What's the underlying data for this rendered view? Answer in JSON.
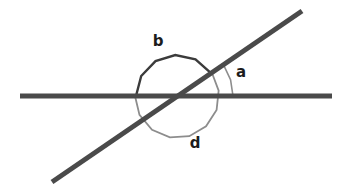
{
  "figure": {
    "width": 345,
    "height": 194,
    "background_color": "#ffffff"
  },
  "colors": {
    "line_stroke": "#4a4a4a",
    "arc_dark": "#3b3b3b",
    "arc_light": "#8d8d8d",
    "label_text": "#1c1c1c"
  },
  "lines": [
    {
      "name": "horizontal-line",
      "x1": 20,
      "y1": 96,
      "x2": 332,
      "y2": 96,
      "stroke_width": 5,
      "color": "#4a4a4a"
    },
    {
      "name": "transversal-line",
      "x1": 52,
      "y1": 182,
      "x2": 302,
      "y2": 11,
      "stroke_width": 5,
      "color": "#4a4a4a"
    }
  ],
  "intersection": {
    "x": 177,
    "y": 96
  },
  "arcs": [
    {
      "name": "angle-arc-a",
      "label": "a",
      "radius": 56,
      "start_deg": 0,
      "end_deg": 34,
      "color": "#8d8d8d",
      "stroke_width": 1.6,
      "label_x": 241,
      "label_y": 72
    },
    {
      "name": "angle-arc-b",
      "label": "b",
      "radius": 41,
      "start_deg": 34,
      "end_deg": 180,
      "color": "#3b3b3b",
      "stroke_width": 2.4,
      "label_x": 158,
      "label_y": 41
    },
    {
      "name": "angle-arc-d",
      "label": "d",
      "radius": 42,
      "start_deg": 180,
      "end_deg": 394,
      "color": "#8d8d8d",
      "stroke_width": 1.8,
      "label_x": 195,
      "label_y": 143
    }
  ],
  "labels": [
    {
      "name": "angle-label-a",
      "text": "a"
    },
    {
      "name": "angle-label-b",
      "text": "b"
    },
    {
      "name": "angle-label-d",
      "text": "d"
    }
  ]
}
